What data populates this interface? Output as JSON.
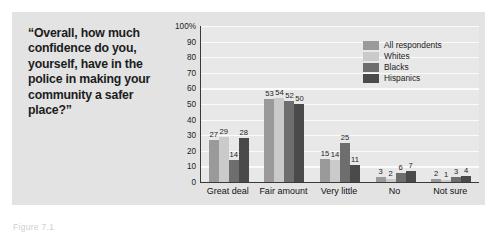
{
  "question": {
    "text": "“Overall, how much confidence do you, yourself, have in the police in making your community a safer place?”"
  },
  "caption": {
    "text": "Figure 7.1"
  },
  "legend": {
    "position": "top-right-inside-plot",
    "items": [
      {
        "label": "All respondents",
        "color": "#9a9a9a"
      },
      {
        "label": "Whites",
        "color": "#cacaca"
      },
      {
        "label": "Blacks",
        "color": "#6e6e6e"
      },
      {
        "label": "Hispanics",
        "color": "#4a4a4a"
      }
    ]
  },
  "chart_data": {
    "type": "bar",
    "title": "",
    "subtitle": "",
    "xlabel": "",
    "ylabel": "",
    "ylim": [
      0,
      100
    ],
    "grid": true,
    "legend_position": "top-right",
    "categories": [
      "Great deal",
      "Fair amount",
      "Very little",
      "No",
      "Not sure"
    ],
    "y_ticks": [
      "0",
      "10",
      "20",
      "30",
      "40",
      "50",
      "60",
      "70",
      "80",
      "90",
      "100%"
    ],
    "y_tick_values": [
      0,
      10,
      20,
      30,
      40,
      50,
      60,
      70,
      80,
      90,
      100
    ],
    "series": [
      {
        "name": "All respondents",
        "color": "#9a9a9a",
        "values": [
          27,
          53,
          15,
          3,
          2
        ]
      },
      {
        "name": "Whites",
        "color": "#cacaca",
        "values": [
          29,
          54,
          14,
          2,
          1
        ]
      },
      {
        "name": "Blacks",
        "color": "#6e6e6e",
        "values": [
          14,
          52,
          25,
          6,
          3
        ]
      },
      {
        "name": "Hispanics",
        "color": "#4a4a4a",
        "values": [
          28,
          50,
          11,
          7,
          4
        ]
      }
    ]
  }
}
